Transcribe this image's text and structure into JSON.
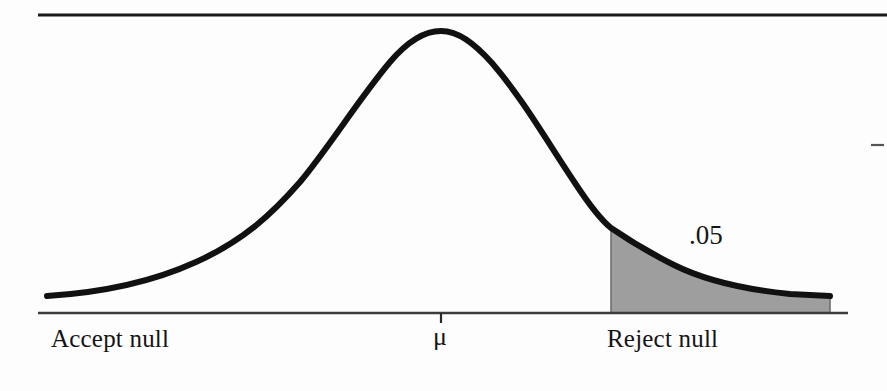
{
  "figure": {
    "kind": "normal-distribution-hypothesis-test",
    "background_color": "#fdfdfd",
    "ink_color": "#111111",
    "shaded_region_fill": "#9e9e9e",
    "shaded_region_stroke": "#6f6f6f",
    "top_rule_color": "#1a1a1a",
    "axis_line_color": "#3c3c3c"
  },
  "labels": {
    "accept_null": "Accept null",
    "mu_symbol": "μ",
    "reject_null": "Reject null",
    "alpha_level": ".05"
  },
  "chart_data": {
    "type": "area",
    "title": "",
    "subtitle": "",
    "xlabel": "",
    "ylabel": "",
    "grid": false,
    "legend_position": "none",
    "distribution": "normal",
    "mean_label": "μ",
    "mean_x_px": 441,
    "baseline_y_px": 313,
    "peak_y_px": 32,
    "curve_start_x_px": 47,
    "curve_end_x_px": 830,
    "critical_value_x_px": 611,
    "critical_value_curve_y_px": 228,
    "tail_area": 0.05,
    "tail_area_label": ".05",
    "tail_side": "right",
    "annotations": [
      {
        "text": "Accept null",
        "x_px": 51,
        "y_px": 326,
        "region": "left-of-critical-value"
      },
      {
        "text": "μ",
        "x_px": 441,
        "y_px": 340,
        "region": "center-mean-tick"
      },
      {
        "text": "Reject null",
        "x_px": 607,
        "y_px": 326,
        "region": "right-tail"
      },
      {
        "text": ".05",
        "x_px": 689,
        "y_px": 222,
        "region": "right-tail-area"
      }
    ],
    "x": [
      47,
      80,
      110,
      140,
      170,
      200,
      230,
      260,
      290,
      320,
      350,
      380,
      410,
      441,
      470,
      500,
      530,
      560,
      590,
      611,
      640,
      670,
      700,
      730,
      760,
      790,
      830
    ],
    "y_px": [
      296,
      293,
      289,
      283,
      275,
      264,
      249,
      230,
      205,
      173,
      135,
      92,
      55,
      32,
      47,
      88,
      136,
      180,
      214,
      228,
      249,
      265,
      277,
      285,
      291,
      294,
      296
    ],
    "values_normalized": [
      0.0,
      0.01,
      0.02,
      0.03,
      0.05,
      0.09,
      0.14,
      0.2,
      0.29,
      0.41,
      0.55,
      0.7,
      0.84,
      0.94,
      0.86,
      0.72,
      0.55,
      0.39,
      0.27,
      0.22,
      0.15,
      0.1,
      0.06,
      0.04,
      0.02,
      0.01,
      0.0
    ],
    "ylim": [
      0,
      1
    ],
    "axis_ticks": [
      {
        "label": "μ",
        "x_px": 441
      }
    ]
  },
  "scan_artifacts": {
    "top_rule": {
      "x1": 38,
      "x2": 887,
      "y": 15
    },
    "right_margin_dash": {
      "x1": 871,
      "x2": 884,
      "y": 145
    }
  }
}
